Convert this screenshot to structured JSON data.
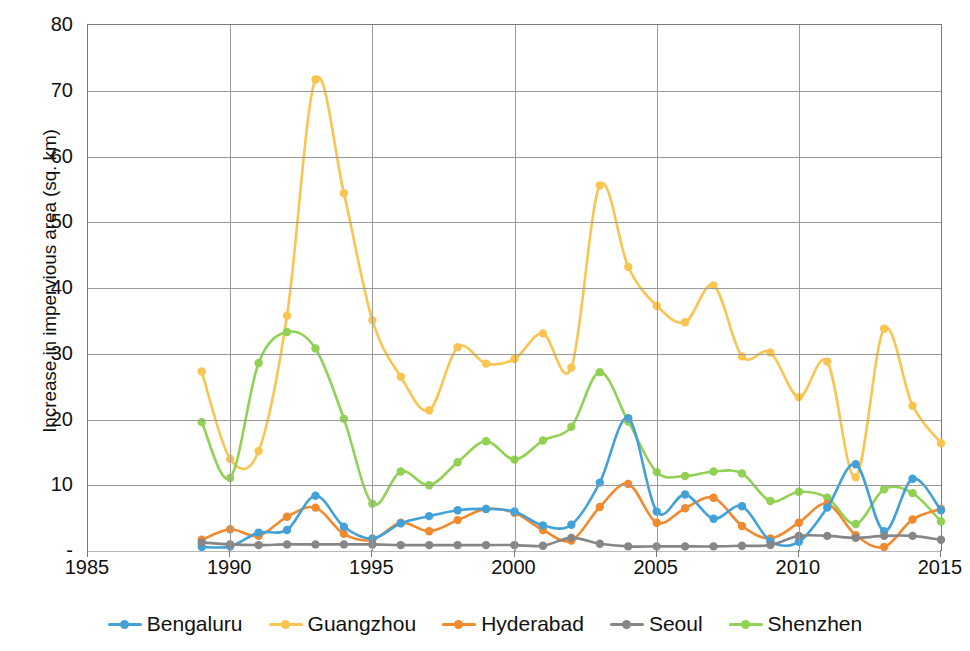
{
  "chart_data": {
    "type": "line",
    "title": "",
    "xlabel": "",
    "ylabel": "Increase in impervious area (sq. km)",
    "xlim": [
      1985,
      2015
    ],
    "ylim": [
      0,
      80
    ],
    "xticks": [
      1985,
      1990,
      1995,
      2000,
      2005,
      2010,
      2015
    ],
    "yticks": [
      0,
      10,
      20,
      30,
      40,
      50,
      60,
      70,
      80
    ],
    "ytick_labels": [
      "-",
      "10",
      "20",
      "30",
      "40",
      "50",
      "60",
      "70",
      "80"
    ],
    "grid": "horizontal-and-vertical",
    "legend_position": "bottom",
    "x": [
      1989,
      1990,
      1991,
      1992,
      1993,
      1994,
      1995,
      1996,
      1997,
      1998,
      1999,
      2000,
      2001,
      2002,
      2003,
      2004,
      2005,
      2006,
      2007,
      2008,
      2009,
      2010,
      2011,
      2012,
      2013,
      2014,
      2015
    ],
    "series": [
      {
        "name": "Bengaluru",
        "color": "#41A1D8",
        "values": [
          0.6,
          0.7,
          2.8,
          3.2,
          8.4,
          3.7,
          1.9,
          4.2,
          5.3,
          6.2,
          6.4,
          6.0,
          3.9,
          4.0,
          10.4,
          20.2,
          6.0,
          8.6,
          4.9,
          6.8,
          1.5,
          1.4,
          6.6,
          13.2,
          3.0,
          11.0,
          6.2
        ]
      },
      {
        "name": "Guangzhou",
        "color": "#FAC451",
        "values": [
          27.3,
          14.0,
          15.2,
          35.8,
          71.7,
          54.4,
          35.1,
          26.5,
          21.4,
          31.0,
          28.5,
          29.2,
          33.1,
          27.9,
          55.6,
          43.2,
          37.3,
          34.8,
          40.4,
          29.6,
          30.2,
          23.4,
          28.8,
          11.2,
          33.8,
          22.1,
          16.4
        ]
      },
      {
        "name": "Hyderabad",
        "color": "#F2892D",
        "values": [
          1.7,
          3.3,
          2.3,
          5.2,
          6.6,
          2.6,
          1.7,
          4.3,
          3.0,
          4.7,
          6.4,
          5.8,
          3.2,
          1.6,
          6.7,
          10.2,
          4.3,
          6.5,
          8.1,
          3.8,
          1.9,
          4.3,
          7.2,
          2.4,
          0.6,
          4.8,
          6.4
        ]
      },
      {
        "name": "Seoul",
        "color": "#868686",
        "values": [
          1.3,
          1.0,
          0.9,
          1.0,
          1.0,
          1.0,
          1.0,
          0.9,
          0.9,
          0.9,
          0.9,
          0.9,
          0.8,
          2.0,
          1.1,
          0.7,
          0.7,
          0.7,
          0.7,
          0.8,
          0.9,
          2.3,
          2.3,
          2.0,
          2.3,
          2.3,
          1.7
        ]
      },
      {
        "name": "Shenzhen",
        "color": "#91D154",
        "values": [
          19.6,
          11.1,
          28.6,
          33.3,
          30.8,
          20.1,
          7.2,
          12.1,
          10.0,
          13.5,
          16.7,
          13.9,
          16.8,
          18.9,
          27.2,
          19.7,
          12.0,
          11.4,
          12.1,
          11.8,
          7.6,
          9.0,
          8.1,
          4.1,
          9.4,
          8.8,
          4.5
        ]
      }
    ]
  },
  "legend": {
    "items": [
      {
        "label": "Bengaluru",
        "color": "#41A1D8"
      },
      {
        "label": "Guangzhou",
        "color": "#FAC451"
      },
      {
        "label": "Hyderabad",
        "color": "#F2892D"
      },
      {
        "label": "Seoul",
        "color": "#868686"
      },
      {
        "label": "Shenzhen",
        "color": "#91D154"
      }
    ]
  }
}
